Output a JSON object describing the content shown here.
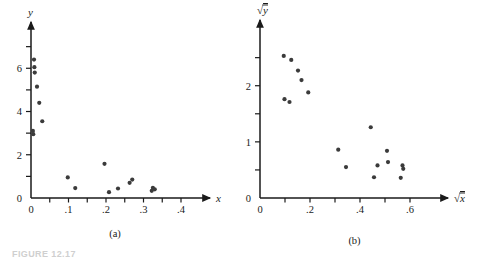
{
  "figure": {
    "caption_partial": "FIGURE 12.17",
    "panels": [
      {
        "id": "a",
        "label": "(a)"
      },
      {
        "id": "b",
        "label": "(b)"
      }
    ]
  },
  "chart_data": [
    {
      "type": "scatter",
      "panel": "(a)",
      "title": "",
      "xlabel": "x",
      "ylabel": "y",
      "xlim": [
        0,
        0.44
      ],
      "ylim": [
        0,
        7.4
      ],
      "xticks": [
        0,
        0.1,
        0.2,
        0.3,
        0.4
      ],
      "xticklabels": [
        "0",
        ".1",
        ".2",
        ".3",
        ".4"
      ],
      "xminorticks": [
        0.05,
        0.15,
        0.25,
        0.35
      ],
      "yticks": [
        0,
        2,
        4,
        6
      ],
      "yticklabels": [
        "0",
        "2",
        "4",
        "6"
      ],
      "yminorticks": [
        1,
        3,
        5,
        7
      ],
      "grid": false,
      "legend": null,
      "points": [
        {
          "x": 0.005,
          "y": 3.1
        },
        {
          "x": 0.006,
          "y": 2.95
        },
        {
          "x": 0.008,
          "y": 6.4
        },
        {
          "x": 0.009,
          "y": 6.05
        },
        {
          "x": 0.01,
          "y": 5.8
        },
        {
          "x": 0.016,
          "y": 5.15
        },
        {
          "x": 0.022,
          "y": 4.4
        },
        {
          "x": 0.03,
          "y": 3.55
        },
        {
          "x": 0.098,
          "y": 0.95
        },
        {
          "x": 0.118,
          "y": 0.46
        },
        {
          "x": 0.196,
          "y": 1.58
        },
        {
          "x": 0.208,
          "y": 0.27
        },
        {
          "x": 0.232,
          "y": 0.44
        },
        {
          "x": 0.263,
          "y": 0.7
        },
        {
          "x": 0.27,
          "y": 0.85
        },
        {
          "x": 0.322,
          "y": 0.33
        },
        {
          "x": 0.325,
          "y": 0.47
        },
        {
          "x": 0.33,
          "y": 0.4
        }
      ]
    },
    {
      "type": "scatter",
      "panel": "(b)",
      "title": "",
      "xlabel": "√x",
      "ylabel": "√y",
      "xlim": [
        0,
        0.68
      ],
      "ylim": [
        0,
        2.85
      ],
      "xticks": [
        0,
        0.2,
        0.4,
        0.6
      ],
      "xticklabels": [
        "0",
        ".2",
        ".4",
        ".6"
      ],
      "xminorticks": [
        0.1,
        0.3,
        0.5
      ],
      "yticks": [
        0,
        1,
        2
      ],
      "yticklabels": [
        "0",
        "1",
        "2"
      ],
      "yminorticks": [
        0.5,
        1.5,
        2.5
      ],
      "grid": false,
      "legend": null,
      "points": [
        {
          "x": 0.095,
          "y": 2.53
        },
        {
          "x": 0.098,
          "y": 1.76
        },
        {
          "x": 0.118,
          "y": 1.71
        },
        {
          "x": 0.125,
          "y": 2.46
        },
        {
          "x": 0.152,
          "y": 2.27
        },
        {
          "x": 0.166,
          "y": 2.1
        },
        {
          "x": 0.193,
          "y": 1.88
        },
        {
          "x": 0.313,
          "y": 0.86
        },
        {
          "x": 0.344,
          "y": 0.55
        },
        {
          "x": 0.443,
          "y": 1.26
        },
        {
          "x": 0.456,
          "y": 0.37
        },
        {
          "x": 0.47,
          "y": 0.58
        },
        {
          "x": 0.508,
          "y": 0.84
        },
        {
          "x": 0.512,
          "y": 0.64
        },
        {
          "x": 0.563,
          "y": 0.36
        },
        {
          "x": 0.57,
          "y": 0.58
        },
        {
          "x": 0.573,
          "y": 0.52
        }
      ]
    }
  ]
}
